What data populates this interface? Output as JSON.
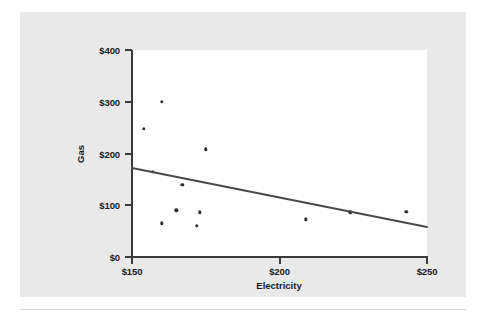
{
  "chart_data": {
    "type": "scatter",
    "title": "",
    "xlabel": "Electricity",
    "ylabel": "Gas",
    "xlim": [
      150,
      250
    ],
    "ylim": [
      0,
      400
    ],
    "grid": false,
    "legend": null,
    "x_ticks": [
      150,
      200,
      250
    ],
    "y_ticks": [
      0,
      100,
      200,
      300,
      400
    ],
    "x_tick_labels": [
      "$150",
      "$200",
      "$250"
    ],
    "y_tick_labels": [
      "$0",
      "$100",
      "$200",
      "$300",
      "$400"
    ],
    "points": [
      {
        "x": 154,
        "y": 248
      },
      {
        "x": 160,
        "y": 300
      },
      {
        "x": 157,
        "y": 165
      },
      {
        "x": 160,
        "y": 65
      },
      {
        "x": 165,
        "y": 90
      },
      {
        "x": 167,
        "y": 140
      },
      {
        "x": 172,
        "y": 60
      },
      {
        "x": 173,
        "y": 86
      },
      {
        "x": 175,
        "y": 208
      },
      {
        "x": 209,
        "y": 73
      },
      {
        "x": 224,
        "y": 86
      },
      {
        "x": 243,
        "y": 87
      }
    ],
    "trendline": {
      "x_start": 150,
      "y_start": 172,
      "x_end": 250,
      "y_end": 58,
      "color": "#4a4a4a"
    },
    "point_color": "#2f2f2f",
    "axis_color": "#3a3a3a",
    "plot_background": "#ffffff",
    "figure_background": "#e9e9e9"
  }
}
